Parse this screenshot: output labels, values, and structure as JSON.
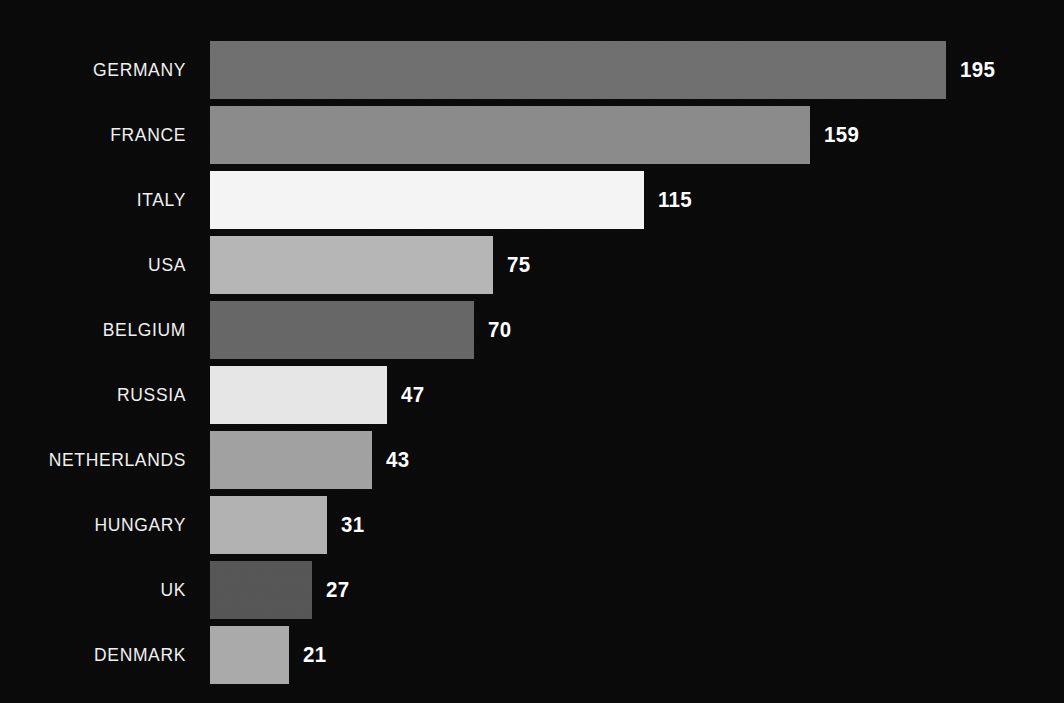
{
  "chart_data": {
    "type": "bar",
    "orientation": "horizontal",
    "title": "",
    "subtitle": "",
    "xlabel": "",
    "ylabel": "",
    "grid": false,
    "legend": null,
    "xlim": [
      0,
      195
    ],
    "axis_visible": false,
    "tick_labels_visible": false,
    "value_labels_visible": true,
    "sorted": "descending",
    "categories": [
      "GERMANY",
      "FRANCE",
      "ITALY",
      "USA",
      "BELGIUM",
      "RUSSIA",
      "NETHERLANDS",
      "HUNGARY",
      "UK",
      "DENMARK"
    ],
    "values": [
      195,
      159,
      115,
      75,
      70,
      47,
      43,
      31,
      27,
      21
    ],
    "bar_colors": [
      "#6f6f6f",
      "#8b8b8b",
      "#f4f4f4",
      "#b6b6b6",
      "#676767",
      "#e6e6e6",
      "#a1a1a1",
      "#b2b2b2",
      "#565656",
      "#aaaaaa"
    ]
  },
  "style": {
    "background_color": "#0a0a0a",
    "label_color": "#f0f0f0",
    "value_color": "#ffffff"
  },
  "bars": [
    {
      "label": "GERMANY",
      "value": 195,
      "value_text": "195",
      "color": "#6f6f6f"
    },
    {
      "label": "FRANCE",
      "value": 159,
      "value_text": "159",
      "color": "#8b8b8b"
    },
    {
      "label": "ITALY",
      "value": 115,
      "value_text": "115",
      "color": "#f4f4f4"
    },
    {
      "label": "USA",
      "value": 75,
      "value_text": "75",
      "color": "#b6b6b6"
    },
    {
      "label": "BELGIUM",
      "value": 70,
      "value_text": "70",
      "color": "#676767"
    },
    {
      "label": "RUSSIA",
      "value": 47,
      "value_text": "47",
      "color": "#e6e6e6"
    },
    {
      "label": "NETHERLANDS",
      "value": 43,
      "value_text": "43",
      "color": "#a1a1a1"
    },
    {
      "label": "HUNGARY",
      "value": 31,
      "value_text": "31",
      "color": "#b2b2b2"
    },
    {
      "label": "UK",
      "value": 27,
      "value_text": "27",
      "color": "#565656"
    },
    {
      "label": "DENMARK",
      "value": 21,
      "value_text": "21",
      "color": "#aaaaaa"
    }
  ]
}
